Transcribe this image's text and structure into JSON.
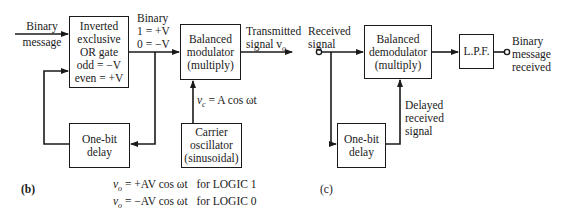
{
  "panel_b": {
    "label": "(b)",
    "input_label": [
      "Binary",
      "message"
    ],
    "xor_gate": {
      "lines": [
        "Inverted",
        "exclusive",
        "OR gate",
        "odd = −V",
        "even = +V"
      ]
    },
    "binary_mapping": [
      "Binary",
      "1 = +V",
      "0 = −V"
    ],
    "modulator": {
      "lines": [
        "Balanced",
        "modulator",
        "(multiply)"
      ]
    },
    "output_label": {
      "line1": "Transmitted",
      "line2_prefix": "signal v",
      "line2_sub": "o"
    },
    "carrier_label": {
      "prefix": "v",
      "sub": "c",
      "rest": " = A cos ωt"
    },
    "oscillator": {
      "lines": [
        "Carrier",
        "oscillator",
        "(sinusoidal)"
      ]
    },
    "delay": {
      "lines": [
        "One-bit",
        "delay"
      ]
    },
    "equations": [
      {
        "lhs": "v",
        "sub": "o",
        "rhs": " = +AV cos ωt",
        "cond": "for LOGIC 1"
      },
      {
        "lhs": "v",
        "sub": "o",
        "rhs": " = −AV cos ωt",
        "cond": "for LOGIC 0"
      }
    ]
  },
  "panel_c": {
    "label": "(c)",
    "input_label": [
      "Received",
      "signal"
    ],
    "demodulator": {
      "lines": [
        "Balanced",
        "demodulator",
        "(multiply)"
      ]
    },
    "lpf": {
      "label": "L.P.F."
    },
    "output_label": [
      "Binary",
      "message",
      "received"
    ],
    "delay": {
      "lines": [
        "One-bit",
        "delay"
      ]
    },
    "delayed_label": [
      "Delayed",
      "received",
      "signal"
    ]
  }
}
